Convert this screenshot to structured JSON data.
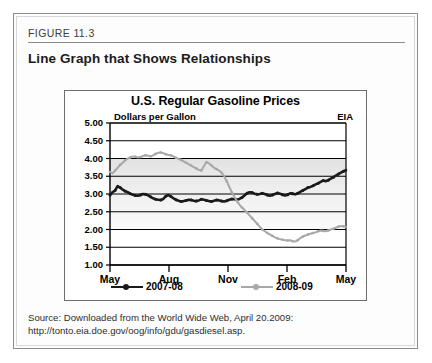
{
  "figure": {
    "label": "FIGURE 11.3",
    "title": "Line Graph that Shows Relationships"
  },
  "source": {
    "line1": "Source: Downloaded from the World Wide Web, April 20.2009:",
    "line2": "http://tonto.eia.doe.gov/oog/info/gdu/gasdiesel.asp."
  },
  "colors": {
    "series_2007_08": "#1a1a1a",
    "series_2008_09": "#a8a8a8",
    "axis": "#000000",
    "panel_border": "#6d6d6d",
    "frame_border": "#8d8d8d"
  },
  "chart_data": {
    "type": "line",
    "title": "U.S. Regular Gasoline Prices",
    "subtitle": "Dollars per Gallon",
    "corner_label": "EIA",
    "xlabel": "",
    "ylabel": "Dollars per Gallon",
    "ylim": [
      1.0,
      5.0
    ],
    "ytick_labels": [
      "5.00",
      "4.50",
      "4.00",
      "3.50",
      "3.00",
      "2.50",
      "2.00",
      "1.50",
      "1.00"
    ],
    "ytick_values": [
      5.0,
      4.5,
      4.0,
      3.5,
      3.0,
      2.5,
      2.0,
      1.5,
      1.0
    ],
    "xtick_labels": [
      "May",
      "Aug",
      "Nov",
      "Feb",
      "May"
    ],
    "xtick_positions": [
      0,
      0.25,
      0.5,
      0.75,
      1.0
    ],
    "grid": true,
    "legend_position": "bottom",
    "series": [
      {
        "name": "2007-08",
        "color": "#1a1a1a",
        "values": [
          2.97,
          3.05,
          3.1,
          3.22,
          3.18,
          3.12,
          3.08,
          3.05,
          3.01,
          2.98,
          2.96,
          2.95,
          2.97,
          3.0,
          2.99,
          2.96,
          2.92,
          2.88,
          2.85,
          2.84,
          2.83,
          2.86,
          2.94,
          2.97,
          2.93,
          2.88,
          2.84,
          2.81,
          2.79,
          2.8,
          2.82,
          2.84,
          2.83,
          2.81,
          2.8,
          2.82,
          2.85,
          2.84,
          2.82,
          2.8,
          2.79,
          2.81,
          2.83,
          2.82,
          2.8,
          2.79,
          2.81,
          2.84,
          2.86,
          2.85,
          2.84,
          2.86,
          2.9,
          2.96,
          3.02,
          3.05,
          3.04,
          3.01,
          2.99,
          3.0,
          3.02,
          3.0,
          2.97,
          2.95,
          2.97,
          3.0,
          3.03,
          3.01,
          2.98,
          2.96,
          2.98,
          3.02,
          3.01,
          2.99,
          3.02,
          3.06,
          3.1,
          3.14,
          3.18,
          3.2,
          3.23,
          3.27,
          3.3,
          3.34,
          3.38,
          3.36,
          3.39,
          3.43,
          3.47,
          3.52,
          3.56,
          3.6,
          3.64,
          3.67
        ]
      },
      {
        "name": "2008-09",
        "color": "#a8a8a8",
        "values": [
          3.62,
          3.58,
          3.66,
          3.74,
          3.82,
          3.88,
          3.95,
          4.0,
          4.03,
          4.06,
          4.05,
          4.03,
          4.04,
          4.07,
          4.09,
          4.08,
          4.06,
          4.09,
          4.13,
          4.16,
          4.17,
          4.15,
          4.12,
          4.1,
          4.09,
          4.06,
          4.02,
          3.99,
          3.96,
          3.92,
          3.88,
          3.84,
          3.8,
          3.76,
          3.72,
          3.68,
          3.66,
          3.78,
          3.9,
          3.86,
          3.8,
          3.74,
          3.7,
          3.66,
          3.6,
          3.5,
          3.36,
          3.2,
          3.05,
          2.92,
          2.8,
          2.7,
          2.62,
          2.55,
          2.48,
          2.4,
          2.32,
          2.24,
          2.16,
          2.08,
          2.0,
          1.95,
          1.9,
          1.86,
          1.82,
          1.78,
          1.75,
          1.73,
          1.71,
          1.7,
          1.69,
          1.7,
          1.67,
          1.66,
          1.7,
          1.76,
          1.8,
          1.83,
          1.86,
          1.88,
          1.9,
          1.92,
          1.95,
          1.97,
          1.96,
          1.95,
          1.97,
          2.0,
          2.02,
          2.05,
          2.08,
          2.1,
          2.09,
          2.07
        ]
      }
    ]
  },
  "legend": [
    {
      "label": "2007-08",
      "color": "#1a1a1a"
    },
    {
      "label": "2008-09",
      "color": "#a8a8a8"
    }
  ]
}
